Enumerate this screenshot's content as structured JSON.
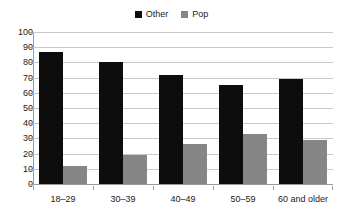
{
  "chart_data": {
    "type": "bar",
    "title": "",
    "subtitle": "",
    "xlabel": "",
    "ylabel": "",
    "categories": [
      "18–29",
      "30–39",
      "40–49",
      "50–59",
      "60 and older"
    ],
    "series": [
      {
        "name": "Other",
        "color": "#0d0d0d",
        "values": [
          87,
          80,
          72,
          65,
          69
        ]
      },
      {
        "name": "Pop",
        "color": "#868686",
        "values": [
          12,
          19,
          26,
          33,
          29
        ]
      }
    ],
    "ylim": [
      0,
      100
    ],
    "ytick_labels": [
      "100",
      "90",
      "80",
      "70",
      "60",
      "50",
      "40",
      "30",
      "20",
      "10",
      "0"
    ],
    "ytick_values": [
      100,
      90,
      80,
      70,
      60,
      50,
      40,
      30,
      20,
      10,
      0
    ],
    "grid": true,
    "grid_axis": "y",
    "legend_position": "top-center",
    "legend": [
      {
        "label": "Other",
        "color": "#0d0d0d"
      },
      {
        "label": "Pop",
        "color": "#868686"
      }
    ],
    "colors": {
      "background": "#ffffff",
      "axis": "#9a9a9a",
      "gridline": "#c8c8c8",
      "text": "#1a1a1a",
      "other": "#0d0d0d",
      "pop": "#868686"
    }
  }
}
